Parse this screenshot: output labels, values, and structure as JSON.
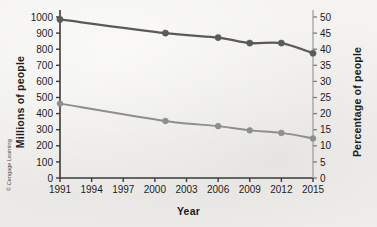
{
  "figure": {
    "credit": "© Cengage Learning",
    "background_color": "#f4f3f1"
  },
  "chart_data": {
    "type": "line",
    "title": "",
    "xlabel": "Year",
    "ylabel": "Millions of people",
    "y2label": "Percentage of people",
    "x": [
      1991,
      2001,
      2006,
      2009,
      2012,
      2015
    ],
    "xlim": [
      1991,
      2015
    ],
    "xticks": [
      1991,
      1994,
      1997,
      2000,
      2003,
      2006,
      2009,
      2012,
      2015
    ],
    "xticklabels": [
      "1991",
      "1994",
      "1997",
      "2000",
      "2003",
      "2006",
      "2009",
      "2012",
      "2015"
    ],
    "ylim": [
      0,
      1000
    ],
    "yticks": [
      0,
      100,
      200,
      300,
      400,
      500,
      600,
      700,
      800,
      900,
      1000
    ],
    "yticklabels": [
      "0",
      "100",
      "200",
      "300",
      "400",
      "500",
      "600",
      "700",
      "800",
      "900",
      "1000"
    ],
    "y2lim": [
      0,
      50
    ],
    "y2ticks": [
      0,
      5,
      10,
      15,
      20,
      25,
      30,
      35,
      40,
      45,
      50
    ],
    "y2ticklabels": [
      "0",
      "5",
      "10",
      "15",
      "20",
      "25",
      "30",
      "35",
      "40",
      "45",
      "50"
    ],
    "grid": false,
    "legend": "none",
    "series": [
      {
        "name": "Millions of people",
        "axis": "left",
        "color": "#5a5a5a",
        "marker": "circle",
        "values": [
          985,
          900,
          872,
          838,
          838,
          775
        ]
      },
      {
        "name": "Percentage of people",
        "axis": "right",
        "color": "#8e8e8e",
        "marker": "circle",
        "values": [
          23.1,
          17.7,
          16.1,
          14.8,
          14.0,
          12.3
        ]
      }
    ]
  }
}
